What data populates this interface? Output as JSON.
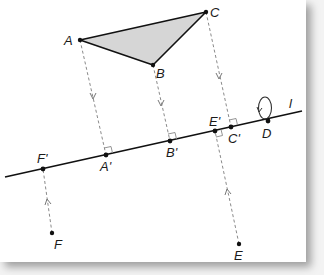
{
  "diagram": {
    "type": "orthogonal projection onto line",
    "line_label": "l",
    "colors": {
      "triangle_fill": "#d6d6d6",
      "stroke": "#111111",
      "dash": "#888888",
      "background": "#ffffff"
    },
    "points": {
      "A": {
        "label": "A",
        "x": 80,
        "y": 40
      },
      "B": {
        "label": "B",
        "x": 153,
        "y": 65
      },
      "C": {
        "label": "C",
        "x": 206,
        "y": 12
      },
      "D": {
        "label": "D",
        "x": 268,
        "y": 121
      },
      "E": {
        "label": "E",
        "x": 239,
        "y": 244
      },
      "F": {
        "label": "F",
        "x": 52,
        "y": 233
      },
      "A_prime": {
        "label": "A'",
        "x": 106,
        "y": 155
      },
      "B_prime": {
        "label": "B'",
        "x": 170,
        "y": 141
      },
      "C_prime": {
        "label": "C'",
        "x": 231,
        "y": 127
      },
      "E_prime": {
        "label": "E'",
        "x": 215,
        "y": 131
      },
      "F_prime": {
        "label": "F'",
        "x": 43,
        "y": 169
      }
    },
    "projections": [
      {
        "from": "A",
        "to": "A'"
      },
      {
        "from": "B",
        "to": "B'"
      },
      {
        "from": "C",
        "to": "C'"
      },
      {
        "from": "E",
        "to": "E'"
      },
      {
        "from": "F",
        "to": "F'"
      }
    ],
    "triangle": [
      "A",
      "B",
      "C"
    ],
    "fixed_point_loop": "D"
  }
}
